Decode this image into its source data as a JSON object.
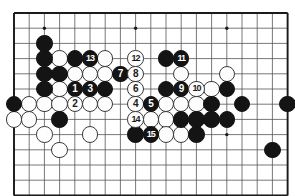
{
  "figure": {
    "kind": "go-board-diagram",
    "board": {
      "columns": 19,
      "visible_rows": 12,
      "grid_origin_x": 14,
      "grid_origin_y": 13,
      "cell_size": 15.2,
      "line_color": "#555555",
      "border_color": "#1a1a1a",
      "background_color": "#ffffff",
      "stone_radius": 8.2
    },
    "star_points": [
      {
        "col": 3,
        "row": 2
      },
      {
        "col": 9,
        "row": 2
      },
      {
        "col": 15,
        "row": 2
      },
      {
        "col": 15,
        "row": 9
      }
    ],
    "move_numbers": [
      {
        "number": "1",
        "color": "black",
        "col": 5,
        "row": 6
      },
      {
        "number": "2",
        "color": "white",
        "col": 5,
        "row": 7
      },
      {
        "number": "3",
        "color": "black",
        "col": 6,
        "row": 6
      },
      {
        "number": "4",
        "color": "white",
        "col": 9,
        "row": 7
      },
      {
        "number": "5",
        "color": "black",
        "col": 10,
        "row": 7
      },
      {
        "number": "6",
        "color": "white",
        "col": 9,
        "row": 6
      },
      {
        "number": "7",
        "color": "black",
        "col": 8,
        "row": 5
      },
      {
        "number": "8",
        "color": "white",
        "col": 9,
        "row": 5
      },
      {
        "number": "9",
        "color": "black",
        "col": 12,
        "row": 6
      },
      {
        "number": "10",
        "color": "white",
        "col": 13,
        "row": 6
      },
      {
        "number": "11",
        "color": "black",
        "col": 12,
        "row": 4
      },
      {
        "number": "12",
        "color": "white",
        "col": 9,
        "row": 4
      },
      {
        "number": "13",
        "color": "black",
        "col": 6,
        "row": 4
      },
      {
        "number": "14",
        "color": "white",
        "col": 9,
        "row": 8
      },
      {
        "number": "15",
        "color": "black",
        "col": 10,
        "row": 9
      }
    ],
    "plain_black_stones": [
      {
        "col": 3,
        "row": 3
      },
      {
        "col": 3,
        "row": 4
      },
      {
        "col": 3,
        "row": 5
      },
      {
        "col": 4,
        "row": 5
      },
      {
        "col": 3,
        "row": 6
      },
      {
        "col": 7,
        "row": 6
      },
      {
        "col": 5,
        "row": 4
      },
      {
        "col": 11,
        "row": 4
      },
      {
        "col": 1,
        "row": 7
      },
      {
        "col": 11,
        "row": 6
      },
      {
        "col": 4,
        "row": 8
      },
      {
        "col": 15,
        "row": 6
      },
      {
        "col": 14,
        "row": 7
      },
      {
        "col": 16,
        "row": 7
      },
      {
        "col": 19,
        "row": 7
      },
      {
        "col": 12,
        "row": 8
      },
      {
        "col": 13,
        "row": 8
      },
      {
        "col": 14,
        "row": 8
      },
      {
        "col": 15,
        "row": 8
      },
      {
        "col": 9,
        "row": 9
      },
      {
        "col": 13,
        "row": 9
      },
      {
        "col": 18,
        "row": 10
      }
    ],
    "plain_white_stones": [
      {
        "col": 4,
        "row": 4
      },
      {
        "col": 7,
        "row": 4
      },
      {
        "col": 5,
        "row": 5
      },
      {
        "col": 6,
        "row": 5
      },
      {
        "col": 7,
        "row": 5
      },
      {
        "col": 12,
        "row": 5
      },
      {
        "col": 15,
        "row": 5
      },
      {
        "col": 4,
        "row": 6
      },
      {
        "col": 14,
        "row": 6
      },
      {
        "col": 2,
        "row": 7
      },
      {
        "col": 3,
        "row": 7
      },
      {
        "col": 4,
        "row": 7
      },
      {
        "col": 6,
        "row": 7
      },
      {
        "col": 7,
        "row": 7
      },
      {
        "col": 11,
        "row": 7
      },
      {
        "col": 12,
        "row": 7
      },
      {
        "col": 13,
        "row": 7
      },
      {
        "col": 1,
        "row": 8
      },
      {
        "col": 2,
        "row": 8
      },
      {
        "col": 10,
        "row": 8
      },
      {
        "col": 11,
        "row": 8
      },
      {
        "col": 3,
        "row": 9
      },
      {
        "col": 6,
        "row": 9
      },
      {
        "col": 11,
        "row": 9
      },
      {
        "col": 12,
        "row": 9
      },
      {
        "col": 4,
        "row": 10
      }
    ]
  }
}
